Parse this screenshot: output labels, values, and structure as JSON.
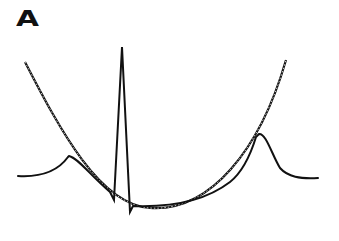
{
  "panel": {
    "label": "A"
  },
  "diagram": {
    "elements": [
      {
        "name": "parabolic-envelope",
        "style": "dotted double line"
      },
      {
        "name": "ecg-waveform",
        "style": "solid line",
        "features": [
          "p-wave",
          "q-dip",
          "r-spike",
          "s-dip",
          "t-wave"
        ]
      }
    ],
    "colors": {
      "stroke": "#111111",
      "background": "#ffffff"
    }
  }
}
